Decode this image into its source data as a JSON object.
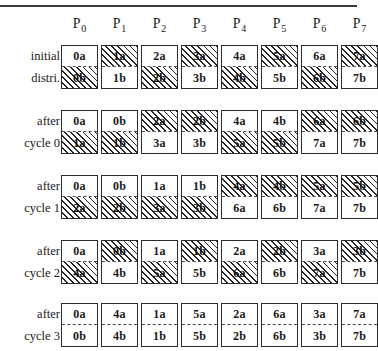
{
  "figure": {
    "type": "data-redistribution-diagram",
    "processor_label_prefix": "P",
    "processors": [
      "0",
      "1",
      "2",
      "3",
      "4",
      "5",
      "6",
      "7"
    ],
    "rows": [
      {
        "label_line1": "initial",
        "label_line2": "distri.",
        "cells": [
          {
            "top": "0a",
            "top_hatched": false,
            "bottom": "0b",
            "bottom_hatched": true
          },
          {
            "top": "1a",
            "top_hatched": true,
            "bottom": "1b",
            "bottom_hatched": false
          },
          {
            "top": "2a",
            "top_hatched": false,
            "bottom": "2b",
            "bottom_hatched": true
          },
          {
            "top": "3a",
            "top_hatched": true,
            "bottom": "3b",
            "bottom_hatched": false
          },
          {
            "top": "4a",
            "top_hatched": false,
            "bottom": "4b",
            "bottom_hatched": true
          },
          {
            "top": "5a",
            "top_hatched": true,
            "bottom": "5b",
            "bottom_hatched": false
          },
          {
            "top": "6a",
            "top_hatched": false,
            "bottom": "6b",
            "bottom_hatched": true
          },
          {
            "top": "7a",
            "top_hatched": true,
            "bottom": "7b",
            "bottom_hatched": false
          }
        ]
      },
      {
        "label_line1": "after",
        "label_line2": "cycle 0",
        "cells": [
          {
            "top": "0a",
            "top_hatched": false,
            "bottom": "1a",
            "bottom_hatched": true
          },
          {
            "top": "0b",
            "top_hatched": false,
            "bottom": "1b",
            "bottom_hatched": true
          },
          {
            "top": "2a",
            "top_hatched": true,
            "bottom": "3a",
            "bottom_hatched": false
          },
          {
            "top": "2b",
            "top_hatched": true,
            "bottom": "3b",
            "bottom_hatched": false
          },
          {
            "top": "4a",
            "top_hatched": false,
            "bottom": "5a",
            "bottom_hatched": true
          },
          {
            "top": "4b",
            "top_hatched": false,
            "bottom": "5b",
            "bottom_hatched": true
          },
          {
            "top": "6a",
            "top_hatched": true,
            "bottom": "7a",
            "bottom_hatched": false
          },
          {
            "top": "6b",
            "top_hatched": true,
            "bottom": "7b",
            "bottom_hatched": false
          }
        ]
      },
      {
        "label_line1": "after",
        "label_line2": "cycle 1",
        "cells": [
          {
            "top": "0a",
            "top_hatched": false,
            "bottom": "2a",
            "bottom_hatched": true
          },
          {
            "top": "0b",
            "top_hatched": false,
            "bottom": "2b",
            "bottom_hatched": true
          },
          {
            "top": "1a",
            "top_hatched": false,
            "bottom": "3a",
            "bottom_hatched": true
          },
          {
            "top": "1b",
            "top_hatched": false,
            "bottom": "3b",
            "bottom_hatched": true
          },
          {
            "top": "4a",
            "top_hatched": true,
            "bottom": "6a",
            "bottom_hatched": false
          },
          {
            "top": "4b",
            "top_hatched": true,
            "bottom": "6b",
            "bottom_hatched": false
          },
          {
            "top": "5a",
            "top_hatched": true,
            "bottom": "7a",
            "bottom_hatched": false
          },
          {
            "top": "5b",
            "top_hatched": true,
            "bottom": "7b",
            "bottom_hatched": false
          }
        ]
      },
      {
        "label_line1": "after",
        "label_line2": "cycle 2",
        "cells": [
          {
            "top": "0a",
            "top_hatched": false,
            "bottom": "4a",
            "bottom_hatched": true
          },
          {
            "top": "0b",
            "top_hatched": true,
            "bottom": "4b",
            "bottom_hatched": false
          },
          {
            "top": "1a",
            "top_hatched": false,
            "bottom": "5a",
            "bottom_hatched": true
          },
          {
            "top": "1b",
            "top_hatched": true,
            "bottom": "5b",
            "bottom_hatched": false
          },
          {
            "top": "2a",
            "top_hatched": false,
            "bottom": "6a",
            "bottom_hatched": true
          },
          {
            "top": "2b",
            "top_hatched": true,
            "bottom": "6b",
            "bottom_hatched": false
          },
          {
            "top": "3a",
            "top_hatched": false,
            "bottom": "7a",
            "bottom_hatched": true
          },
          {
            "top": "3b",
            "top_hatched": true,
            "bottom": "7b",
            "bottom_hatched": false
          }
        ]
      },
      {
        "label_line1": "after",
        "label_line2": "cycle 3",
        "cells": [
          {
            "top": "0a",
            "top_hatched": false,
            "bottom": "0b",
            "bottom_hatched": false
          },
          {
            "top": "4a",
            "top_hatched": false,
            "bottom": "4b",
            "bottom_hatched": false
          },
          {
            "top": "1a",
            "top_hatched": false,
            "bottom": "1b",
            "bottom_hatched": false
          },
          {
            "top": "5a",
            "top_hatched": false,
            "bottom": "5b",
            "bottom_hatched": false
          },
          {
            "top": "2a",
            "top_hatched": false,
            "bottom": "2b",
            "bottom_hatched": false
          },
          {
            "top": "6a",
            "top_hatched": false,
            "bottom": "6b",
            "bottom_hatched": false
          },
          {
            "top": "3a",
            "top_hatched": false,
            "bottom": "3b",
            "bottom_hatched": false
          },
          {
            "top": "7a",
            "top_hatched": false,
            "bottom": "7b",
            "bottom_hatched": false
          }
        ]
      }
    ],
    "layout": {
      "column_x": [
        61,
        101,
        141,
        181,
        221,
        261,
        301,
        341
      ],
      "row_y": [
        45,
        110,
        175,
        240,
        303
      ],
      "label_x": 2,
      "box_width": 37,
      "box_height": 44
    },
    "colors": {
      "box_border": "#2b2b2b",
      "hatch": "#262626",
      "divider": "#4a4a4a",
      "text": "#1a1a1a",
      "rule": "#3a3a3a"
    }
  }
}
